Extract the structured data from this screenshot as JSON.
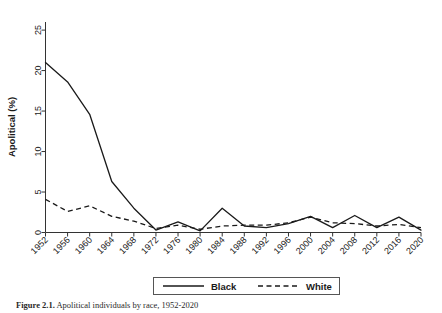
{
  "figure": {
    "caption_label": "Figure 2.1.",
    "caption_text": "Apolitical individuals by race, 1952-2020"
  },
  "axes": {
    "ylabel": "Apolitical (%)",
    "yticks": [
      "0",
      "5",
      "10",
      "15",
      "20",
      "25"
    ],
    "xticks": [
      "1952",
      "1956",
      "1960",
      "1964",
      "1968",
      "1972",
      "1976",
      "1980",
      "1984",
      "1988",
      "1992",
      "1996",
      "2000",
      "2004",
      "2008",
      "2012",
      "2016",
      "2020"
    ]
  },
  "legend": {
    "entries": [
      {
        "label": "Black",
        "style": "solid"
      },
      {
        "label": "White",
        "style": "dashed"
      }
    ]
  },
  "chart_data": {
    "type": "line",
    "title": "",
    "xlabel": "",
    "ylabel": "Apolitical (%)",
    "xlim": [
      1952,
      2020
    ],
    "ylim": [
      0,
      26
    ],
    "grid": false,
    "legend_position": "bottom",
    "x": [
      1952,
      1956,
      1960,
      1964,
      1968,
      1972,
      1976,
      1980,
      1984,
      1988,
      1992,
      1996,
      2000,
      2004,
      2008,
      2012,
      2016,
      2020
    ],
    "series": [
      {
        "name": "Black",
        "style": "solid",
        "color": "#1a1a1a",
        "values": [
          21.0,
          18.6,
          14.6,
          6.3,
          3.0,
          0.3,
          1.3,
          0.2,
          3.0,
          0.8,
          0.6,
          1.1,
          2.0,
          0.6,
          2.1,
          0.6,
          1.9,
          0.3
        ]
      },
      {
        "name": "White",
        "style": "dashed",
        "color": "#1a1a1a",
        "values": [
          4.1,
          2.6,
          3.3,
          2.0,
          1.4,
          0.5,
          0.9,
          0.4,
          0.8,
          0.9,
          0.9,
          1.2,
          1.9,
          1.2,
          1.1,
          0.8,
          1.0,
          0.6
        ]
      }
    ]
  }
}
